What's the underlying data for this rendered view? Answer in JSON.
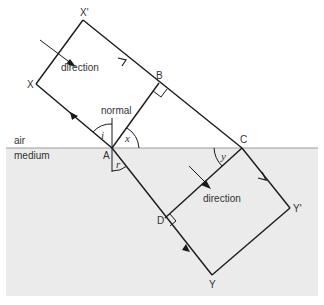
{
  "diagram": {
    "media": {
      "upper": "air",
      "lower": "medium"
    },
    "colors": {
      "medium_fill": "#ebebeb",
      "line": "#1a1a1a",
      "boundary": "#9a9a9a"
    },
    "points": {
      "X_prime": "X'",
      "X": "X",
      "A": "A",
      "B": "B",
      "C": "C",
      "D": "D",
      "Y": "Y",
      "Y_prime": "Y'"
    },
    "labels": {
      "normal": "normal",
      "direction_incident": "direction",
      "direction_refracted": "direction"
    },
    "angles": {
      "i": "i",
      "x": "x",
      "r": "r",
      "y": "y"
    }
  }
}
